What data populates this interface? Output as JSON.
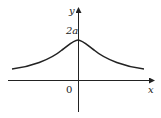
{
  "diagram": {
    "title": "",
    "x_axis_label": "x",
    "y_axis_label": "y",
    "origin_label": "0",
    "peak_label": "2a",
    "curve": "y = 8a^3/(x^2+4a^2)",
    "colors": {
      "stroke": "#222222",
      "background": "#ffffff"
    }
  }
}
